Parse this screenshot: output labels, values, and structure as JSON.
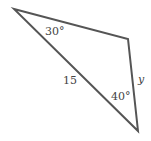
{
  "diagram": {
    "type": "triangle",
    "stroke_color": "#555555",
    "vertices": [
      {
        "id": "A",
        "x": 14,
        "y": 9
      },
      {
        "id": "B",
        "x": 128,
        "y": 39
      },
      {
        "id": "C",
        "x": 138,
        "y": 131
      }
    ],
    "labels": {
      "angle_A": "30°",
      "side_AC": "15",
      "angle_C": "40°",
      "side_BC": "y"
    }
  }
}
